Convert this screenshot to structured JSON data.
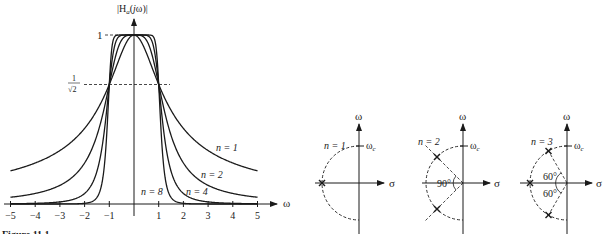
{
  "figure": {
    "caption_fragment": "Figure 11.1"
  },
  "magnitude_plot": {
    "ylabel": "|H_a(jω)|",
    "ylabel_parts": {
      "pre": "|H",
      "sub": "a",
      "mid": "(",
      "j": "j",
      "post": "ω)|"
    },
    "xlabel": "ω",
    "level_one_label": "1",
    "level_half_power_label_num": "1",
    "level_half_power_label_den": "√2",
    "x_ticks": [
      "−5",
      "−4",
      "−3",
      "−2",
      "−1",
      "1",
      "2",
      "3",
      "4",
      "5"
    ],
    "curve_labels": [
      {
        "n": 1,
        "text": "n = 1"
      },
      {
        "n": 2,
        "text": "n = 2"
      },
      {
        "n": 4,
        "text": "n = 4"
      },
      {
        "n": 8,
        "text": "n = 8"
      }
    ]
  },
  "pole_diagrams": [
    {
      "n": 3,
      "order_label": "n = 1",
      "axis_v": "ω",
      "axis_h": "σ",
      "cutoff": "ω",
      "cutoff_sub": "c",
      "angles": []
    },
    {
      "n": 2,
      "order_label": "n = 2",
      "axis_v": "ω",
      "axis_h": "σ",
      "cutoff": "ω",
      "cutoff_sub": "c",
      "angles": [
        "90°"
      ]
    },
    {
      "n": 3,
      "order_label": "n = 3",
      "axis_v": "ω",
      "axis_h": "σ",
      "cutoff": "ω",
      "cutoff_sub": "c",
      "angles": [
        "60°",
        "60°"
      ]
    }
  ],
  "chart_data": {
    "type": "line",
    "xlabel": "ω",
    "ylabel": "|H_a(jω)|",
    "xlim": [
      -5,
      5
    ],
    "ylim": [
      0,
      1
    ],
    "x_ticks": [
      -5,
      -4,
      -3,
      -2,
      -1,
      1,
      2,
      3,
      4,
      5
    ],
    "y_reference_lines": [
      {
        "value": 1,
        "label": "1"
      },
      {
        "value": 0.7071,
        "label": "1/√2"
      }
    ],
    "grid": false,
    "x": [
      -5,
      -4,
      -3,
      -2,
      -1.5,
      -1,
      -0.5,
      0,
      0.5,
      1,
      1.5,
      2,
      3,
      4,
      5
    ],
    "series": [
      {
        "name": "n = 1",
        "n": 1,
        "values": [
          0.196,
          0.243,
          0.316,
          0.447,
          0.555,
          0.707,
          0.894,
          1,
          0.894,
          0.707,
          0.555,
          0.447,
          0.316,
          0.243,
          0.196
        ]
      },
      {
        "name": "n = 2",
        "n": 2,
        "values": [
          0.04,
          0.062,
          0.11,
          0.243,
          0.406,
          0.707,
          0.97,
          1,
          0.97,
          0.707,
          0.406,
          0.243,
          0.11,
          0.062,
          0.04
        ]
      },
      {
        "name": "n = 4",
        "n": 4,
        "values": [
          0.0016,
          0.0039,
          0.0123,
          0.062,
          0.194,
          0.707,
          0.998,
          1,
          0.998,
          0.707,
          0.194,
          0.062,
          0.0123,
          0.0039,
          0.0016
        ]
      },
      {
        "name": "n = 8",
        "n": 8,
        "values": [
          0,
          0,
          0,
          0.0039,
          0.039,
          0.707,
          1,
          1,
          1,
          0.707,
          0.039,
          0.0039,
          0,
          0,
          0
        ]
      }
    ],
    "pole_plots": [
      {
        "n": 1,
        "poles_deg": [
          180
        ]
      },
      {
        "n": 2,
        "poles_deg": [
          135,
          225
        ],
        "angle_between": "90°"
      },
      {
        "n": 3,
        "poles_deg": [
          120,
          180,
          240
        ],
        "angle_between": "60°"
      }
    ]
  }
}
